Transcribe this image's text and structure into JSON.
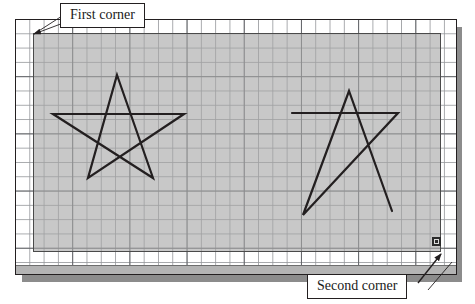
{
  "canvas": {
    "width": 475,
    "height": 304,
    "background_color": "#ffffff",
    "grid": {
      "minor_spacing_px": 14,
      "major_spacing_px": 57,
      "minor_color": "#96989c",
      "major_color": "#5a5c60",
      "visible": true
    }
  },
  "drawing_frame": {
    "name": "drawing-area",
    "border_color": "#231f20",
    "shadow_color": "#8c8c8c"
  },
  "selection": {
    "label": "crossing-selection-window",
    "fill_color": "#a6a6a6",
    "border_color": "#4a4a4a",
    "first_corner": {
      "x": 33,
      "y": 33
    },
    "second_corner": {
      "x": 441,
      "y": 252
    }
  },
  "grip": {
    "label": "corner-grip",
    "fill_color": "#dcdcdc",
    "border_color": "#2b2b2b"
  },
  "callouts": [
    {
      "id": "first-corner",
      "text": "First corner",
      "box": {
        "x": 60,
        "y": 3
      },
      "leader_from": {
        "x": 60,
        "y": 20
      },
      "leader_to": {
        "x": 33,
        "y": 33
      }
    },
    {
      "id": "second-corner",
      "text": "Second corner",
      "box": {
        "x": 307,
        "y": 274
      },
      "leader_from": {
        "x": 420,
        "y": 281
      },
      "leader_to": {
        "x": 438,
        "y": 256
      }
    }
  ],
  "shapes": [
    {
      "id": "complete-star",
      "name": "star-left-complete",
      "type": "polygon",
      "stroke_color": "#231f20",
      "stroke_width": 2.2,
      "closed": true,
      "points": [
        [
          117,
          75
        ],
        [
          153,
          178
        ],
        [
          53,
          114
        ],
        [
          184,
          114
        ],
        [
          88,
          178
        ]
      ]
    },
    {
      "id": "partial-star",
      "name": "star-right-partial",
      "type": "polyline",
      "stroke_color": "#231f20",
      "stroke_width": 2.2,
      "closed": false,
      "points": [
        [
          292,
          113
        ],
        [
          398,
          113
        ],
        [
          303,
          215
        ],
        [
          349,
          91
        ],
        [
          392,
          211
        ]
      ]
    }
  ],
  "chart_data": {
    "type": "scatter",
    "title": "",
    "xlabel": "",
    "ylabel": "",
    "annotations": [
      "First corner",
      "Second corner"
    ]
  }
}
